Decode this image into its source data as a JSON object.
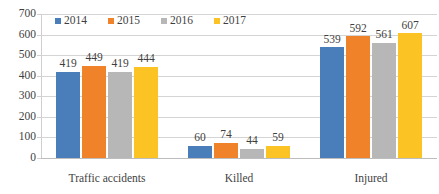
{
  "chart_data": {
    "type": "bar",
    "title": "",
    "xlabel": "",
    "ylabel": "",
    "categories": [
      "Traffic accidents",
      "Killed",
      "Injured"
    ],
    "series": [
      {
        "name": "2014",
        "color": "#4a7ebb",
        "values": [
          419,
          60,
          539
        ]
      },
      {
        "name": "2015",
        "color": "#f0822a",
        "values": [
          449,
          74,
          592
        ]
      },
      {
        "name": "2016",
        "color": "#b7b7b7",
        "values": [
          419,
          44,
          561
        ]
      },
      {
        "name": "2017",
        "color": "#fbc424",
        "values": [
          444,
          59,
          607
        ]
      }
    ],
    "ylim": [
      0,
      700
    ],
    "yticks": [
      0,
      100,
      200,
      300,
      400,
      500,
      600,
      700
    ],
    "ytick_labels": [
      "0",
      "100",
      "200",
      "300",
      "400",
      "500",
      "600",
      "700"
    ],
    "grid": true,
    "legend_position": "top-left-inside",
    "data_labels": true
  },
  "legend": {
    "items": [
      {
        "label": "2014",
        "color": "#4a7ebb"
      },
      {
        "label": "2015",
        "color": "#f0822a"
      },
      {
        "label": "2016",
        "color": "#b7b7b7"
      },
      {
        "label": "2017",
        "color": "#fbc424"
      }
    ]
  }
}
